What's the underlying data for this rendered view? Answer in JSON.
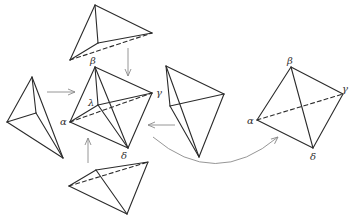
{
  "figure": {
    "colors": {
      "edge": "#2b2b2b",
      "arrow": "#8a8a8a",
      "label": "#333333"
    }
  },
  "central_tetrahedron": {
    "labels": {
      "beta": "β",
      "gamma": "γ",
      "lambda": "λ",
      "alpha": "α",
      "delta": "δ"
    }
  },
  "result_tetrahedron": {
    "labels": {
      "beta": "β",
      "gamma": "γ",
      "alpha": "α",
      "delta": "δ"
    }
  },
  "pieces": [
    {
      "name": "top-piece",
      "arrow_direction": "down"
    },
    {
      "name": "left-piece",
      "arrow_direction": "right"
    },
    {
      "name": "right-piece",
      "arrow_direction": "left"
    },
    {
      "name": "bottom-piece",
      "arrow_direction": "up"
    }
  ],
  "mapping_arrow": {
    "from": "central-tetrahedron",
    "to": "result-tetrahedron",
    "shape": "curved"
  }
}
